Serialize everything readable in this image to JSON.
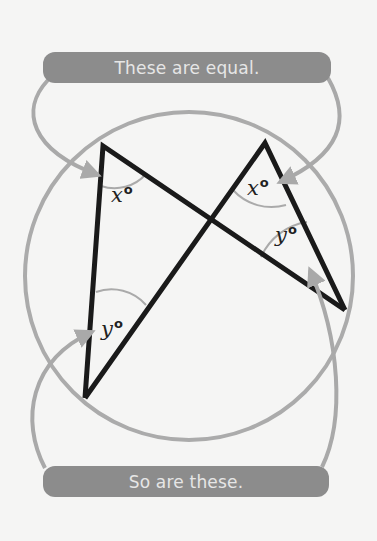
{
  "top_callout": {
    "text": "These are equal."
  },
  "bottom_callout": {
    "text": "So are these."
  },
  "angles": {
    "left_top": {
      "var": "x",
      "unit": "o"
    },
    "right_top": {
      "var": "x",
      "unit": "o"
    },
    "left_bottom": {
      "var": "y",
      "unit": "o"
    },
    "right_bottom": {
      "var": "y",
      "unit": "o"
    }
  },
  "colors": {
    "pill": "#8c8c8c",
    "pill_text": "#e6e6e6",
    "circle": "#a9a9a9",
    "arrow": "#a9a9a9",
    "triangle": "#1a1a1a",
    "background": "#f5f5f4"
  }
}
